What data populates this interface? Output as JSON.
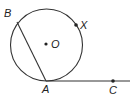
{
  "diagram": {
    "type": "geometry-circle-tangent",
    "colors": {
      "stroke": "#333333",
      "point": "#222222",
      "background": "#ffffff"
    },
    "circle": {
      "center_label": "O",
      "cx": 46.5,
      "cy": 45,
      "r": 36
    },
    "points": [
      {
        "id": "B",
        "label": "B",
        "x": 17,
        "y": 22,
        "label_x": 4,
        "label_y": 17
      },
      {
        "id": "X",
        "label": "X",
        "x": 76,
        "y": 25,
        "label_x": 81,
        "label_y": 29
      },
      {
        "id": "O",
        "label": "O",
        "x": 46,
        "y": 44,
        "label_x": 51,
        "label_y": 48
      },
      {
        "id": "A",
        "label": "A",
        "x": 46,
        "y": 81,
        "label_x": 42,
        "label_y": 93
      },
      {
        "id": "C",
        "label": "C",
        "x": 113,
        "y": 81,
        "label_x": 109,
        "label_y": 94
      }
    ],
    "segments": [
      {
        "name": "chord-BA",
        "from": "B",
        "to": "A"
      },
      {
        "name": "tangent-AC",
        "from": "A",
        "to_x": 130,
        "to_y": 81
      }
    ]
  }
}
